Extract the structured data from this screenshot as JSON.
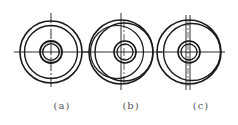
{
  "figures": [
    {
      "id": "a",
      "label": "(a)",
      "label_x": 62,
      "center": [
        51,
        52
      ],
      "circles": [
        {
          "cx": 51,
          "cy": 52,
          "r": 31,
          "w": 1.6
        },
        {
          "cx": 51,
          "cy": 52,
          "r": 26.5,
          "w": 1.4
        },
        {
          "cx": 51,
          "cy": 52,
          "r": 11,
          "w": 1.8
        },
        {
          "cx": 51,
          "cy": 52,
          "r": 8.3,
          "w": 1.4
        }
      ],
      "lines": [
        {
          "x1": 14,
          "y1": 52,
          "x2": 91,
          "y2": 52,
          "w": 0.9,
          "dash": ""
        },
        {
          "x1": 51,
          "y1": 13,
          "x2": 51,
          "y2": 88,
          "w": 0.9,
          "dash": "10 2 2 2"
        }
      ]
    },
    {
      "id": "b",
      "label": "(b)",
      "label_x": 131,
      "center": [
        122,
        52
      ],
      "circles": [
        {
          "cx": 121,
          "cy": 52,
          "r": 32,
          "w": 1.6
        },
        {
          "cx": 124,
          "cy": 52,
          "r": 29,
          "w": 1.4
        },
        {
          "cx": 117,
          "cy": 52,
          "r": 26.5,
          "w": 1.2
        },
        {
          "cx": 125,
          "cy": 52,
          "r": 11,
          "w": 1.6
        },
        {
          "cx": 125,
          "cy": 52,
          "r": 8,
          "w": 1.3
        }
      ],
      "lines": [
        {
          "x1": 83,
          "y1": 52,
          "x2": 162,
          "y2": 52,
          "w": 0.9,
          "dash": ""
        },
        {
          "x1": 121,
          "y1": 13,
          "x2": 121,
          "y2": 90,
          "w": 0.9,
          "dash": ""
        },
        {
          "x1": 124,
          "y1": 20,
          "x2": 124,
          "y2": 86,
          "w": 0.7,
          "dash": "8 2 2 2"
        }
      ]
    },
    {
      "id": "c",
      "label": "(c)",
      "label_x": 201,
      "center": [
        189,
        52
      ],
      "circles": [
        {
          "cx": 189,
          "cy": 52,
          "r": 32,
          "w": 1.6
        },
        {
          "cx": 192,
          "cy": 52,
          "r": 28.5,
          "w": 1.4
        },
        {
          "cx": 189,
          "cy": 52,
          "r": 11,
          "w": 1.6
        },
        {
          "cx": 189,
          "cy": 52,
          "r": 8,
          "w": 1.3
        }
      ],
      "lines": [
        {
          "x1": 157,
          "y1": 52,
          "x2": 225,
          "y2": 52,
          "w": 0.9,
          "dash": ""
        },
        {
          "x1": 186,
          "y1": 15,
          "x2": 186,
          "y2": 90,
          "w": 0.9,
          "dash": ""
        },
        {
          "x1": 190,
          "y1": 15,
          "x2": 190,
          "y2": 90,
          "w": 0.9,
          "dash": ""
        },
        {
          "x1": 188,
          "y1": 20,
          "x2": 188,
          "y2": 86,
          "w": 0.6,
          "dash": "6 2 2 2"
        }
      ]
    }
  ],
  "stroke_color": "#1a1a1a",
  "label_color": "#555555"
}
